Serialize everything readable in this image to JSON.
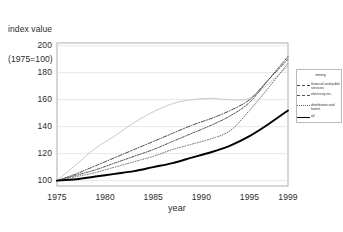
{
  "chart_data": {
    "type": "line",
    "title": "",
    "ylabel_line1": "index value",
    "ylabel_line2": "(1975=100)",
    "xlabel": "year",
    "xlim": [
      1975,
      1999
    ],
    "ylim": [
      96,
      202
    ],
    "yticks": [
      100,
      120,
      140,
      160,
      180,
      200
    ],
    "xticks": [
      1975,
      1980,
      1985,
      1990,
      1995,
      1999
    ],
    "grid": "horizontal",
    "legend_position": "right",
    "x": [
      1975,
      1977,
      1979,
      1981,
      1983,
      1985,
      1987,
      1989,
      1991,
      1993,
      1995,
      1997,
      1999
    ],
    "series": [
      {
        "name": "mining",
        "label": "mining",
        "style": "solid-light",
        "color": "#c8c8c8",
        "width": 1.0,
        "values": [
          100,
          112,
          124,
          133,
          143,
          151,
          157,
          160,
          161,
          160,
          161,
          172,
          185
        ]
      },
      {
        "name": "financial and public services",
        "label": "financial and public services",
        "style": "dashdot",
        "color": "#4a4a4a",
        "width": 1.0,
        "values": [
          100,
          105,
          111,
          117,
          123,
          129,
          135,
          141,
          146,
          152,
          160,
          175,
          190
        ]
      },
      {
        "name": "electricity etc.",
        "label": "electricity etc.",
        "style": "dashdot-fine",
        "color": "#555555",
        "width": 1.0,
        "values": [
          100,
          104,
          108,
          113,
          118,
          123,
          129,
          135,
          141,
          148,
          158,
          175,
          192
        ]
      },
      {
        "name": "distribution and hotels",
        "label": "distribution and hotels",
        "style": "dotted",
        "color": "#6a6a6a",
        "width": 1.0,
        "values": [
          100,
          103,
          106,
          110,
          114,
          118,
          123,
          127,
          131,
          137,
          152,
          169,
          187
        ]
      },
      {
        "name": "all",
        "label": "all",
        "style": "solid-bold",
        "color": "#000000",
        "width": 1.9,
        "values": [
          100,
          101,
          103,
          105,
          107,
          110,
          113,
          117,
          121,
          126,
          133,
          142,
          152
        ]
      }
    ]
  },
  "legend": {
    "items": [
      {
        "label": "mining"
      },
      {
        "label": "financial and public services"
      },
      {
        "label": "electricity etc."
      },
      {
        "label": "distribution and hotels"
      },
      {
        "label": "all"
      }
    ]
  }
}
